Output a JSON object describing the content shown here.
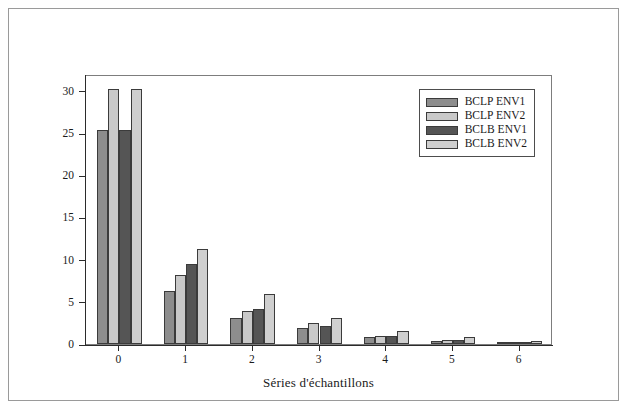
{
  "figure": {
    "outer_border": true
  },
  "chart_data": {
    "type": "bar",
    "title": "",
    "xlabel": "Séries d'échantillons",
    "ylabel": "Résistance en compression (MPa)",
    "categories": [
      "0",
      "1",
      "2",
      "3",
      "4",
      "5",
      "6"
    ],
    "yticks": [
      "0",
      "5",
      "10",
      "15",
      "20",
      "25",
      "30"
    ],
    "ylim": [
      0,
      32
    ],
    "grid": false,
    "legend_position": "top-right",
    "series": [
      {
        "name": "BCLP ENV1",
        "color": "#8d8d8d",
        "values": [
          25.4,
          6.3,
          3.1,
          1.9,
          0.8,
          0.4,
          0.15
        ]
      },
      {
        "name": "BCLP ENV2",
        "color": "#c9c9c9",
        "values": [
          30.2,
          8.2,
          3.9,
          2.5,
          1.0,
          0.5,
          0.2
        ]
      },
      {
        "name": "BCLB ENV1",
        "color": "#555555",
        "values": [
          25.4,
          9.5,
          4.1,
          2.1,
          1.0,
          0.5,
          0.2
        ]
      },
      {
        "name": "BCLB ENV2",
        "color": "#cfcfcf",
        "values": [
          30.2,
          11.3,
          5.9,
          3.1,
          1.5,
          0.8,
          0.35
        ]
      }
    ]
  }
}
